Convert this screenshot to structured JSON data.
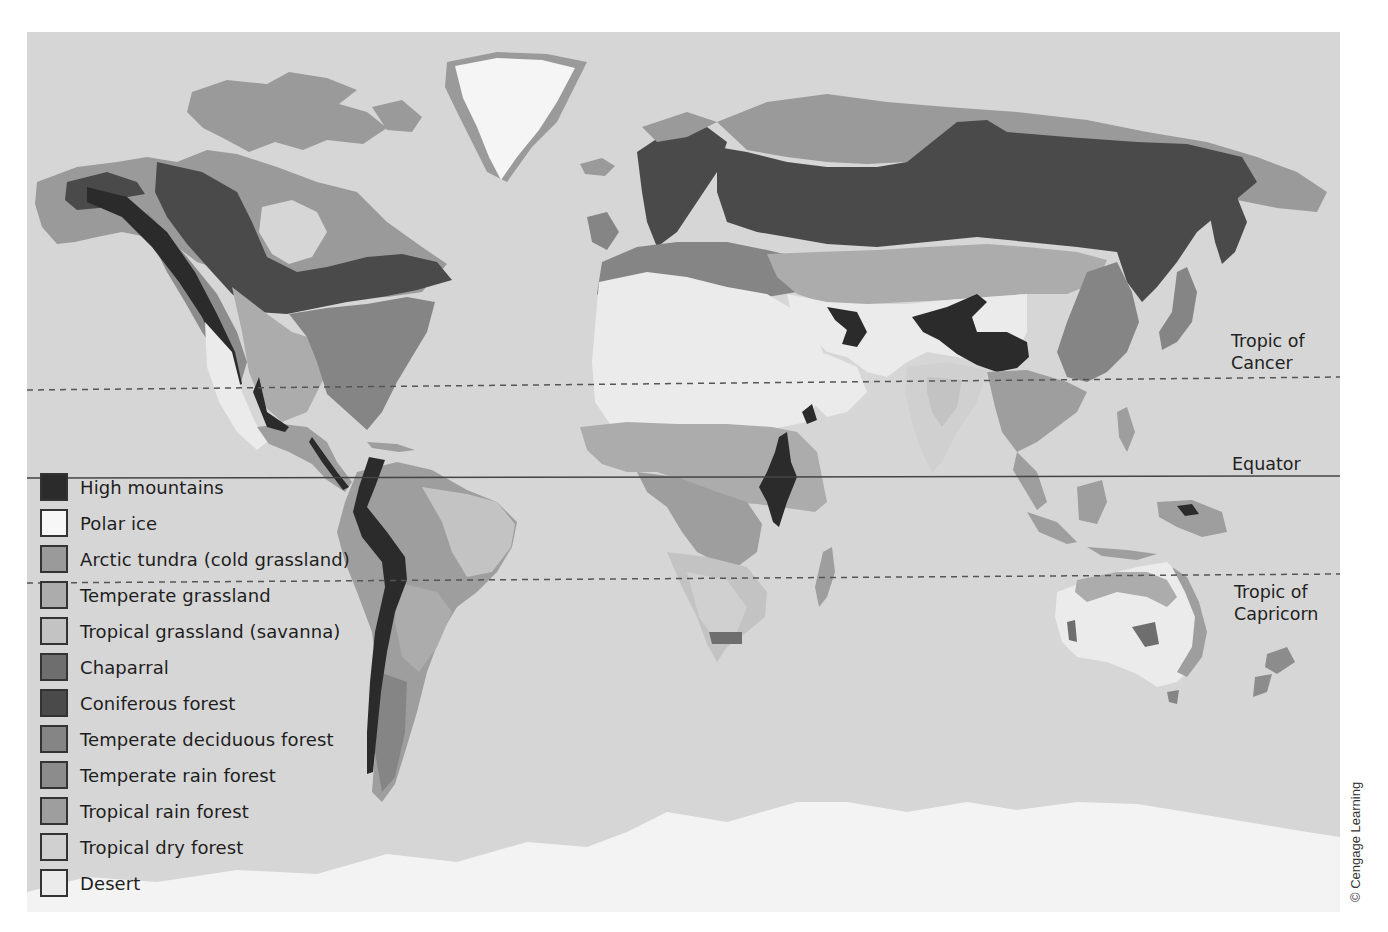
{
  "map": {
    "title": "World biomes map",
    "reference_lines": {
      "tropic_of_cancer": "Tropic of\nCancer",
      "tropic_of_cancer_line1": "Tropic of",
      "tropic_of_cancer_line2": "Cancer",
      "equator": "Equator",
      "tropic_of_capricorn_line1": "Tropic of",
      "tropic_of_capricorn_line2": "Capricorn"
    },
    "legend": {
      "items": [
        {
          "label": "High mountains",
          "color": "#2b2b2b"
        },
        {
          "label": "Polar ice",
          "color": "#f7f7f7"
        },
        {
          "label": "Arctic tundra (cold grassland)",
          "color": "#9a9a9a"
        },
        {
          "label": "Temperate grassland",
          "color": "#acacac"
        },
        {
          "label": "Tropical grassland (savanna)",
          "color": "#c3c3c3"
        },
        {
          "label": "Chaparral",
          "color": "#6e6e6e"
        },
        {
          "label": "Coniferous forest",
          "color": "#4a4a4a"
        },
        {
          "label": "Temperate deciduous forest",
          "color": "#858585"
        },
        {
          "label": "Temperate rain forest",
          "color": "#8c8c8c"
        },
        {
          "label": "Tropical rain forest",
          "color": "#9e9e9e"
        },
        {
          "label": "Tropical dry forest",
          "color": "#d0d0d0"
        },
        {
          "label": "Desert",
          "color": "#ebebeb"
        }
      ]
    },
    "ocean_color": "#d6d6d6",
    "credit": "© Cengage Learning"
  }
}
